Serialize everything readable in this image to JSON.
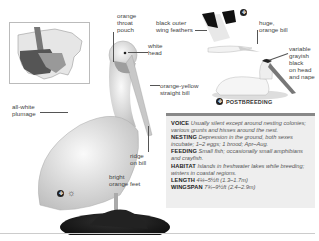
{
  "map": {
    "alt": "Range map of North America"
  },
  "labels": {
    "orange_throat_pouch": [
      "orange",
      "throat",
      "pouch"
    ],
    "white_head": [
      "white",
      "head"
    ],
    "orange_yellow_bill": [
      "orange-yellow",
      "straight bill"
    ],
    "all_white_plumage": [
      "all-white",
      "plumage"
    ],
    "ridge_on_bill": [
      "ridge",
      "on bill"
    ],
    "bright_orange_feet": [
      "bright",
      "orange feet"
    ],
    "black_outer_wing": [
      "black outer",
      "wing feathers"
    ],
    "huge_orange_bill": [
      "huge,",
      "orange bill"
    ],
    "variable_grayish": [
      "variable",
      "grayish",
      "black",
      "on head",
      "and nape"
    ],
    "postbreeding": "POSTBREEDING"
  },
  "info": {
    "voice": {
      "key": "VOICE",
      "value": "Usually silent except around nesting colonies; various grunts and hisses around the nest."
    },
    "nesting": {
      "key": "NESTING",
      "value": "Depression in the ground, both sexes incubate; 1–2 eggs; 1 brood; Apr–Aug."
    },
    "feeding": {
      "key": "FEEDING",
      "value": "Small fish; occasionally small amphibians and crayfish."
    },
    "habitat": {
      "key": "HABITAT",
      "value": "Islands in freshwater lakes while breeding; winters in coastal regions."
    },
    "length": {
      "key": "LENGTH",
      "value": "4¼–5½ft (1.3–1.7m)"
    },
    "wingspan": {
      "key": "WINGSPAN",
      "value": "7¾–9½ft (2.4–2.9m)"
    }
  },
  "colors": {
    "infobox_bg": "#eeeeee",
    "rule": "#888888"
  }
}
